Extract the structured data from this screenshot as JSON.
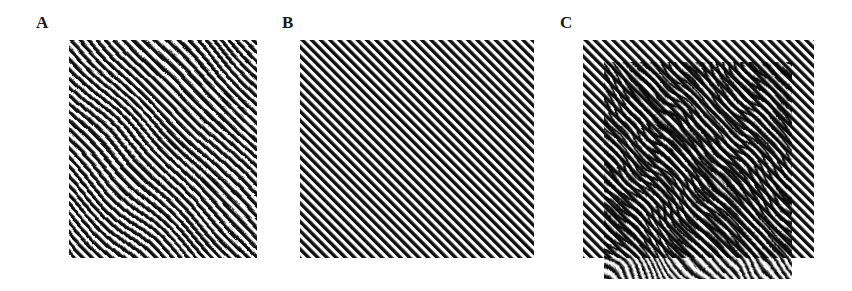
{
  "figure": {
    "panels": [
      {
        "label": "A",
        "description": "Diagonal grating with smooth local warp (distorted lines near center)",
        "stripe_color": "#111111",
        "background": "#ffffff",
        "stripe_period_px": 6.5,
        "orientation": "lower-left to upper-right"
      },
      {
        "label": "B",
        "description": "Regular straight diagonal grating",
        "stripe_color": "#111111",
        "background": "#ffffff",
        "stripe_period_px": 6.5,
        "orientation": "lower-left to upper-right"
      },
      {
        "label": "C",
        "description": "Superposition of A and B (offset) producing moiré swirl pattern",
        "stripe_color": "#111111",
        "background": "#ffffff"
      }
    ]
  }
}
